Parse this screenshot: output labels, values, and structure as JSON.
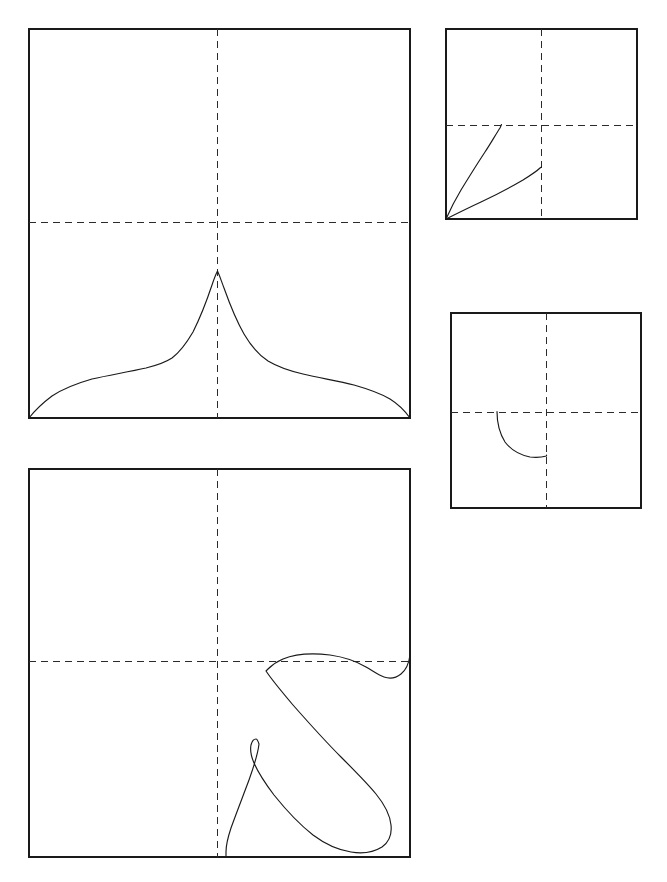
{
  "figure": {
    "title": "",
    "background_color": "#ffffff",
    "stroke_color": "#1a1a1a",
    "guide_color": "#2b2b2b",
    "width": 667,
    "height": 882,
    "panel_count": 4
  },
  "panels": [
    {
      "id": "panel-top-left",
      "name": "large-peaked-distribution-panel",
      "x": 29,
      "y": 29,
      "width": 381,
      "height": 389,
      "guides": {
        "vertical_x_frac": 0.494,
        "horizontal_y_frac": 0.496
      },
      "curve_count": 1,
      "description": "cusped unimodal peak"
    },
    {
      "id": "panel-top-right",
      "name": "small-two-rising-curves-panel",
      "x": 446,
      "y": 29,
      "width": 191,
      "height": 190,
      "guides": {
        "vertical_x_frac": 0.497,
        "horizontal_y_frac": 0.505
      },
      "curve_count": 2,
      "description": "two concave rising arcs from origin"
    },
    {
      "id": "panel-middle-right",
      "name": "small-quarter-arc-panel",
      "x": 451,
      "y": 313,
      "width": 190,
      "height": 195,
      "guides": {
        "vertical_x_frac": 0.5,
        "horizontal_y_frac": 0.507
      },
      "curve_count": 1,
      "description": "quarter arc from horizontal guide to vertical guide"
    },
    {
      "id": "panel-bottom-left",
      "name": "large-hooked-loop-panel",
      "x": 29,
      "y": 469,
      "width": 381,
      "height": 388,
      "guides": {
        "vertical_x_frac": 0.494,
        "horizontal_y_frac": 0.495
      },
      "curve_count": 1,
      "description": "self-intersecting hooked loop in lower-right quadrant"
    }
  ],
  "chart_data": {
    "type": "line",
    "title": "",
    "subtitle": "",
    "xlabel": "",
    "ylabel": "",
    "grid": false,
    "legend": "none",
    "axis_ticks": [],
    "panels": [
      {
        "panel": "panel-top-left",
        "type": "line",
        "xlim": [
          0,
          1
        ],
        "ylim": [
          0,
          1
        ],
        "guides": {
          "vx": 0.494,
          "hy": 0.504
        },
        "series": [
          {
            "name": "peaked-curve",
            "x": [
              0.0,
              0.03,
              0.07,
              0.12,
              0.18,
              0.24,
              0.3,
              0.36,
              0.42,
              0.465,
              0.494,
              0.525,
              0.57,
              0.63,
              0.7,
              0.77,
              0.84,
              0.9,
              0.95,
              0.985,
              1.0
            ],
            "y": [
              0.0,
              0.03,
              0.055,
              0.073,
              0.086,
              0.098,
              0.112,
              0.14,
              0.2,
              0.28,
              0.375,
              0.278,
              0.195,
              0.135,
              0.105,
              0.09,
              0.078,
              0.066,
              0.05,
              0.022,
              0.0
            ]
          }
        ]
      },
      {
        "panel": "panel-top-right",
        "type": "line",
        "xlim": [
          0,
          1
        ],
        "ylim": [
          0,
          1
        ],
        "guides": {
          "vx": 0.497,
          "hy": 0.495
        },
        "series": [
          {
            "name": "steep-rising-curve",
            "x": [
              0.0,
              0.04,
              0.09,
              0.15,
              0.21,
              0.26,
              0.29
            ],
            "y": [
              0.0,
              0.13,
              0.26,
              0.38,
              0.455,
              0.49,
              0.495
            ]
          },
          {
            "name": "shallow-rising-curve",
            "x": [
              0.0,
              0.09,
              0.19,
              0.3,
              0.4,
              0.47,
              0.497
            ],
            "y": [
              0.0,
              0.055,
              0.11,
              0.17,
              0.225,
              0.262,
              0.275
            ]
          }
        ]
      },
      {
        "panel": "panel-middle-right",
        "type": "line",
        "xlim": [
          0,
          1
        ],
        "ylim": [
          0,
          1
        ],
        "guides": {
          "vx": 0.5,
          "hy": 0.493
        },
        "series": [
          {
            "name": "quarter-arc",
            "x": [
              0.242,
              0.245,
              0.262,
              0.3,
              0.355,
              0.42,
              0.47,
              0.5
            ],
            "y": [
              0.493,
              0.43,
              0.37,
              0.32,
              0.285,
              0.27,
              0.268,
              0.27
            ]
          }
        ]
      },
      {
        "panel": "panel-bottom-left",
        "type": "line",
        "xlim": [
          0,
          1
        ],
        "ylim": [
          0,
          1
        ],
        "guides": {
          "vx": 0.494,
          "hy": 0.495
        },
        "series": [
          {
            "name": "hooked-loop-curve",
            "x": [
              1.0,
              0.985,
              0.955,
              0.93,
              0.905,
              0.86,
              0.79,
              0.72,
              0.66,
              0.64,
              0.7,
              0.79,
              0.88,
              0.95,
              0.99,
              1.0,
              0.985,
              0.94,
              0.88,
              0.8,
              0.72,
              0.65,
              0.605,
              0.592,
              0.585,
              0.57,
              0.545,
              0.53,
              0.525,
              0.535,
              0.545,
              0.54,
              0.52
            ],
            "y": [
              0.46,
              0.472,
              0.478,
              0.47,
              0.452,
              0.432,
              0.42,
              0.422,
              0.437,
              0.455,
              0.52,
              0.6,
              0.68,
              0.76,
              0.84,
              0.91,
              0.96,
              0.985,
              0.985,
              0.955,
              0.9,
              0.835,
              0.775,
              0.73,
              0.68,
              0.64,
              0.62,
              0.66,
              0.74,
              0.83,
              0.92,
              0.975,
              1.0
            ]
          }
        ]
      }
    ]
  }
}
